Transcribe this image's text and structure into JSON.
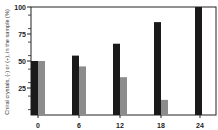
{
  "chart_data": {
    "type": "bar",
    "title": "",
    "xlabel": "",
    "ylabel": "Chiral crystals, (-) or (+), in the sample (%)",
    "categories": [
      "0",
      "6",
      "12",
      "18",
      "24"
    ],
    "series": [
      {
        "name": "dominant enantiomer",
        "color": "#1a1a1a",
        "values": [
          50,
          55,
          66,
          86,
          100
        ]
      },
      {
        "name": "minor enantiomer",
        "color": "#8c8c8c",
        "values": [
          50,
          45,
          35,
          14,
          0
        ]
      }
    ],
    "ylim": [
      0,
      100
    ],
    "yticks": [
      25,
      50,
      75,
      100
    ],
    "ytick_labels": [
      "25",
      "50",
      "75",
      "100"
    ],
    "grid": false,
    "legend": "none"
  }
}
